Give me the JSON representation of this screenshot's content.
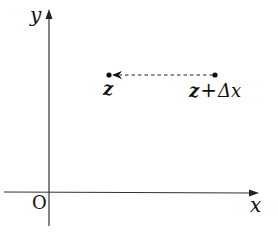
{
  "diagram": {
    "type": "coordinate-plane",
    "axes": {
      "x_label": "x",
      "y_label": "y",
      "origin_label": "O"
    },
    "points": [
      {
        "id": "z",
        "label": "z",
        "x": 109,
        "y": 75
      },
      {
        "id": "z-plus-dx",
        "label_main": "z",
        "label_op": "+",
        "label_delta": "Δx",
        "x": 215,
        "y": 75
      }
    ],
    "arrow": {
      "from": "z-plus-dx",
      "to": "z",
      "style": "dashed"
    },
    "colors": {
      "line": "#222222",
      "background": "#ffffff"
    }
  }
}
